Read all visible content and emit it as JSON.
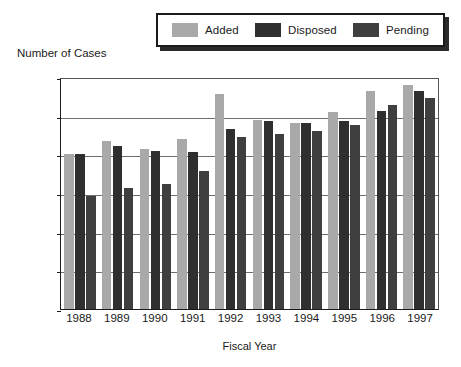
{
  "legend": {
    "position": "top-center",
    "entries": [
      {
        "label": "Added",
        "color": "#a9a9a9",
        "swatch_name": "legend-swatch-added"
      },
      {
        "label": "Disposed",
        "color": "#2f2f2f",
        "swatch_name": "legend-swatch-disposed"
      },
      {
        "label": "Pending",
        "color": "#3f3f3f",
        "swatch_name": "legend-swatch-pending"
      }
    ]
  },
  "axes": {
    "y_title": "Number of Cases",
    "x_title": "Fiscal Year",
    "y_ticks": [
      "12,000",
      "10,000",
      "8,000",
      "6,000",
      "4,000",
      "2,000",
      "0"
    ]
  },
  "chart_data": {
    "type": "bar",
    "title": "",
    "subtitle": "",
    "xlabel": "Fiscal Year",
    "ylabel": "Number of Cases",
    "ylim": [
      0,
      12000
    ],
    "ytick_values": [
      0,
      2000,
      4000,
      6000,
      8000,
      10000,
      12000
    ],
    "ytick_labels": [
      "0",
      "2,000",
      "4,000",
      "6,000",
      "8,000",
      "10,000",
      "12,000"
    ],
    "grid": true,
    "grid_axis": "y",
    "legend_position": "top-center",
    "categories": [
      "1988",
      "1989",
      "1990",
      "1991",
      "1992",
      "1993",
      "1994",
      "1995",
      "1996",
      "1997"
    ],
    "series": [
      {
        "name": "Added",
        "color": "#a9a9a9",
        "values": [
          8000,
          8700,
          8300,
          8800,
          11100,
          9800,
          9600,
          10200,
          11300,
          11600
        ]
      },
      {
        "name": "Disposed",
        "color": "#2f2f2f",
        "values": [
          8000,
          8450,
          8150,
          8100,
          9300,
          9700,
          9600,
          9700,
          10250,
          11300
        ]
      },
      {
        "name": "Pending",
        "color": "#3f3f3f",
        "values": [
          5850,
          6250,
          6450,
          7150,
          8900,
          9050,
          9200,
          9500,
          10550,
          10900
        ]
      }
    ]
  }
}
